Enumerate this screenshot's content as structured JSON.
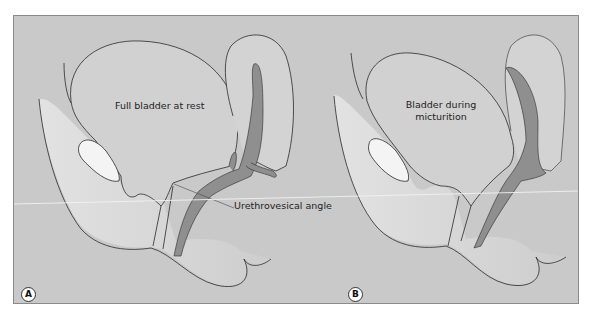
{
  "figure": {
    "panels": [
      {
        "id": "A",
        "badge": "A",
        "bladder_label": "Full bladder at rest",
        "annotation": "Urethrovesical angle"
      },
      {
        "id": "B",
        "badge": "B",
        "bladder_label_line1": "Bladder during",
        "bladder_label_line2": "micturition"
      }
    ],
    "colors": {
      "background": "#c9c9c9",
      "tissue_fill": "#d6d6d6",
      "bone_fill": "#f4f4f4",
      "lumen_fill": "#8f8f8f",
      "outline": "#2a2a2a"
    }
  }
}
